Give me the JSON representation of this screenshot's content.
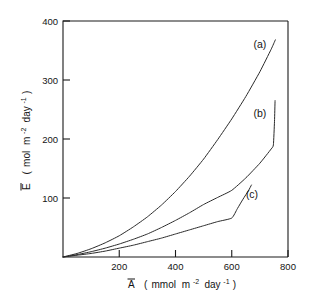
{
  "chart_data": {
    "type": "line",
    "title": "",
    "xlabel": "A̅  ( mmol  m⁻²  day⁻¹ )",
    "ylabel": "E̅  ( mol  m⁻²  day⁻¹ )",
    "xlabel_parts": {
      "symbol": "A",
      "open_paren": "(",
      "unit_main": "mmol",
      "unit_m": "m",
      "exp_m": "-2",
      "unit_day": "day",
      "exp_day": "-1",
      "close_paren": ")"
    },
    "ylabel_parts": {
      "symbol": "E",
      "open_paren": "(",
      "unit_main": "mol",
      "unit_m": "m",
      "exp_m": "-2",
      "unit_day": "day",
      "exp_day": "-1",
      "close_paren": ")"
    },
    "xlim": [
      0,
      800
    ],
    "ylim": [
      0,
      400
    ],
    "xticks": [
      200,
      400,
      600,
      800
    ],
    "yticks": [
      100,
      200,
      300,
      400
    ],
    "xtick_labels": [
      "200",
      "400",
      "600",
      "800"
    ],
    "ytick_labels": [
      "100",
      "200",
      "300",
      "400"
    ],
    "grid": false,
    "legend_position": "inline-annotations",
    "frame": "top-left-box",
    "series": [
      {
        "name": "(a)",
        "label": "(a)",
        "label_x": 700,
        "label_y": 355,
        "color": "#2a2a2a",
        "points": [
          [
            0,
            0
          ],
          [
            50,
            6
          ],
          [
            100,
            14
          ],
          [
            150,
            24
          ],
          [
            200,
            36
          ],
          [
            250,
            51
          ],
          [
            300,
            68
          ],
          [
            350,
            88
          ],
          [
            400,
            111
          ],
          [
            450,
            137
          ],
          [
            500,
            166
          ],
          [
            550,
            199
          ],
          [
            600,
            234
          ],
          [
            650,
            272
          ],
          [
            700,
            314
          ],
          [
            740,
            352
          ],
          [
            755,
            368
          ]
        ]
      },
      {
        "name": "(b)",
        "label": "(b)",
        "label_x": 700,
        "label_y": 238,
        "color": "#2a2a2a",
        "points": [
          [
            0,
            0
          ],
          [
            50,
            4
          ],
          [
            100,
            9
          ],
          [
            150,
            15
          ],
          [
            200,
            22
          ],
          [
            250,
            30
          ],
          [
            300,
            39
          ],
          [
            350,
            50
          ],
          [
            400,
            62
          ],
          [
            450,
            75
          ],
          [
            500,
            89
          ],
          [
            550,
            101
          ],
          [
            600,
            113
          ],
          [
            650,
            134
          ],
          [
            700,
            159
          ],
          [
            740,
            183
          ],
          [
            748,
            190
          ],
          [
            752,
            230
          ],
          [
            754,
            265
          ]
        ]
      },
      {
        "name": "(c)",
        "label": "(c)",
        "label_x": 672,
        "label_y": 100,
        "color": "#2a2a2a",
        "points": [
          [
            0,
            0
          ],
          [
            50,
            3
          ],
          [
            100,
            6
          ],
          [
            150,
            10
          ],
          [
            200,
            15
          ],
          [
            250,
            20
          ],
          [
            300,
            26
          ],
          [
            350,
            32
          ],
          [
            400,
            39
          ],
          [
            450,
            46
          ],
          [
            500,
            53
          ],
          [
            550,
            60
          ],
          [
            600,
            66
          ],
          [
            620,
            82
          ],
          [
            640,
            98
          ],
          [
            660,
            113
          ],
          [
            670,
            122
          ]
        ]
      }
    ]
  }
}
